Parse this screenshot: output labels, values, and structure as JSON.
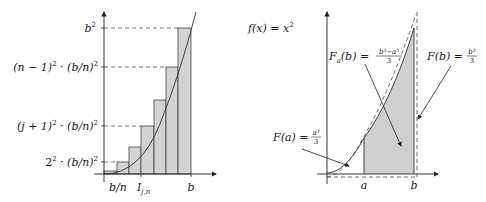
{
  "left_diagram": {
    "y_labels": {
      "b2": "b",
      "b2_sup": "2",
      "n1_a": "(n − 1)",
      "n1_sup": "2",
      "n1_b": " · (b/n)",
      "n1_sup2": "2",
      "j1_a": "(j + 1)",
      "j1_sup": "2",
      "j1_b": " · (b/n)",
      "j1_sup2": "2",
      "two_a": "2",
      "two_sup": "2",
      "two_b": " · (b/n)",
      "two_sup2": "2"
    },
    "x_labels": {
      "bn": "b/n",
      "I": "I",
      "I_sub": "j,n",
      "b": "b"
    },
    "colors": {
      "bar_fill": "#d3d3d3",
      "stroke": "#333333"
    }
  },
  "right_diagram": {
    "function_label": "f(x) = x",
    "function_sup": "2",
    "Fa_label": "F(a) = ",
    "Fa_num": "a³",
    "Fa_den": "3",
    "Fab_label": "F",
    "Fab_sub": "a",
    "Fab_rest": "(b) = ",
    "Fab_num": "b³−a³",
    "Fab_den": "3",
    "Fb_label": "F(b) = ",
    "Fb_num": "b³",
    "Fb_den": "3",
    "x_labels": {
      "a": "a",
      "b": "b"
    },
    "colors": {
      "area_fill": "#cfcfcf",
      "stroke": "#333333"
    }
  }
}
